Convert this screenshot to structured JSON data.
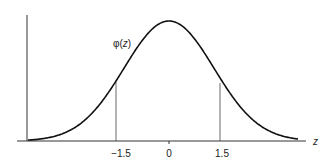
{
  "diagram": {
    "curve_label": "φ(z)",
    "curve_label_parts": {
      "func": "φ",
      "open": "(",
      "var": "z",
      "close": ")"
    },
    "x_axis_label": "z",
    "ticks": [
      {
        "value": -1.5,
        "label": "−1.5"
      },
      {
        "value": 0,
        "label": "0"
      },
      {
        "value": 1.5,
        "label": "1.5"
      }
    ],
    "vertical_markers": [
      -1.5,
      1.5
    ],
    "colors": {
      "curve": "#111111",
      "axis": "#333333",
      "marker": "#444444",
      "text": "#222222"
    }
  },
  "chart_data": {
    "type": "line",
    "title": "",
    "xlabel": "z",
    "ylabel": "φ(z)",
    "series": [
      {
        "name": "φ(z)",
        "function": "standard normal pdf"
      }
    ],
    "x_ticks": [
      -1.5,
      0,
      1.5
    ],
    "markers": [
      -1.5,
      1.5
    ],
    "grid": false
  }
}
